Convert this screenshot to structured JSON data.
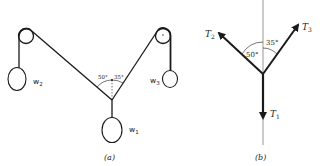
{
  "figure_a": {
    "caption": "(a)",
    "weights": {
      "w1": {
        "base": "w",
        "sub": "1"
      },
      "w2": {
        "base": "w",
        "sub": "2"
      },
      "w3": {
        "base": "w",
        "sub": "3"
      }
    },
    "angles": {
      "left": "50°",
      "right": "35°"
    }
  },
  "figure_b": {
    "caption": "(b)",
    "forces": {
      "T1": {
        "base": "T",
        "sub": "1"
      },
      "T2": {
        "base": "T",
        "sub": "2"
      },
      "T3": {
        "base": "T",
        "sub": "3"
      }
    },
    "angles": {
      "left": "50°",
      "right": "35°"
    }
  }
}
